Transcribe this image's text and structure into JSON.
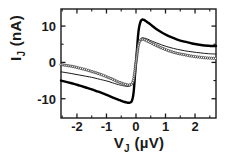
{
  "chart_data": {
    "type": "line",
    "title": "",
    "xlabel": "V_J (µV)",
    "xlabel_main": "V",
    "xlabel_sub": "J",
    "xlabel_unit": " (µV)",
    "ylabel": "I_J (nA)",
    "ylabel_main": "I",
    "ylabel_sub": "J",
    "ylabel_unit": " (nA)",
    "xlim": [
      -2.54,
      2.71
    ],
    "ylim": [
      -15.3,
      14.7
    ],
    "xticks": [
      -2,
      -1,
      0,
      1,
      2
    ],
    "xticklabels": [
      "-2",
      "-1",
      "0",
      "1",
      "2"
    ],
    "yticks": [
      -10,
      0,
      10
    ],
    "yticklabels": [
      "-10",
      "0",
      "10"
    ],
    "minor_xticks": [
      -2.5,
      -1.5,
      -0.5,
      0.5,
      1.5,
      2.5
    ],
    "minor_yticks": [
      -5,
      5
    ],
    "grid": false,
    "legend": false,
    "frame": true,
    "tick_direction": "in",
    "colors": {
      "axis": "#1a1a1a",
      "curve_thick": "#000000",
      "curve_thin": "#1a1a1a",
      "curve_marker": "#333333",
      "background": "#ffffff"
    },
    "series": [
      {
        "name": "thick-solid-curve",
        "style": "solid",
        "linewidth": 2.4,
        "marker": "none",
        "x": [
          -2.54,
          -2.3,
          -2.1,
          -1.9,
          -1.7,
          -1.5,
          -1.3,
          -1.1,
          -0.95,
          -0.8,
          -0.65,
          -0.55,
          -0.45,
          -0.38,
          -0.32,
          -0.27,
          -0.22,
          -0.18,
          -0.14,
          -0.1,
          -0.07,
          -0.04,
          -0.02,
          0.0,
          0.02,
          0.04,
          0.07,
          0.1,
          0.14,
          0.18,
          0.22,
          0.27,
          0.33,
          0.4,
          0.5,
          0.62,
          0.78,
          0.95,
          1.15,
          1.4,
          1.65,
          1.9,
          2.2,
          2.45,
          2.71
        ],
        "y": [
          -5.0,
          -5.5,
          -5.9,
          -6.4,
          -6.9,
          -7.4,
          -8.0,
          -8.6,
          -9.1,
          -9.6,
          -10.1,
          -10.4,
          -10.7,
          -10.9,
          -11.0,
          -11.1,
          -11.1,
          -11.0,
          -10.6,
          -9.4,
          -7.4,
          -4.2,
          -2.0,
          0.0,
          2.0,
          4.2,
          7.4,
          9.4,
          10.9,
          11.6,
          11.8,
          11.7,
          11.4,
          11.0,
          10.4,
          9.6,
          8.7,
          7.9,
          7.1,
          6.3,
          5.7,
          5.2,
          4.8,
          4.6,
          4.5
        ]
      },
      {
        "name": "thin-solid-curve",
        "style": "solid",
        "linewidth": 1.0,
        "marker": "none",
        "x": [
          -2.54,
          -2.3,
          -2.1,
          -1.9,
          -1.7,
          -1.5,
          -1.3,
          -1.1,
          -0.95,
          -0.8,
          -0.65,
          -0.55,
          -0.45,
          -0.38,
          -0.32,
          -0.27,
          -0.22,
          -0.18,
          -0.14,
          -0.1,
          -0.07,
          -0.04,
          -0.02,
          0.0,
          0.02,
          0.04,
          0.07,
          0.1,
          0.14,
          0.18,
          0.22,
          0.27,
          0.33,
          0.4,
          0.5,
          0.62,
          0.78,
          0.95,
          1.15,
          1.4,
          1.65,
          1.9,
          2.2,
          2.45,
          2.71
        ],
        "y": [
          -2.6,
          -2.9,
          -3.2,
          -3.5,
          -3.8,
          -4.1,
          -4.5,
          -4.9,
          -5.2,
          -5.6,
          -6.0,
          -6.2,
          -6.4,
          -6.5,
          -6.6,
          -6.6,
          -6.5,
          -6.4,
          -6.1,
          -5.4,
          -4.3,
          -2.4,
          -1.2,
          0.0,
          1.2,
          2.4,
          4.3,
          5.4,
          6.2,
          6.7,
          6.8,
          6.7,
          6.6,
          6.4,
          6.0,
          5.6,
          5.1,
          4.6,
          4.1,
          3.6,
          3.2,
          2.9,
          2.6,
          2.4,
          2.3
        ]
      },
      {
        "name": "open-circle-marker-curve",
        "style": "markers",
        "linewidth": 0.9,
        "marker": "open-circle",
        "x": [
          -2.54,
          -2.3,
          -2.1,
          -1.9,
          -1.7,
          -1.5,
          -1.3,
          -1.1,
          -0.95,
          -0.8,
          -0.65,
          -0.55,
          -0.45,
          -0.38,
          -0.32,
          -0.27,
          -0.22,
          -0.18,
          -0.14,
          -0.1,
          -0.07,
          -0.04,
          -0.02,
          0.0,
          0.02,
          0.04,
          0.07,
          0.1,
          0.14,
          0.18,
          0.22,
          0.27,
          0.33,
          0.4,
          0.5,
          0.62,
          0.78,
          0.95,
          1.15,
          1.4,
          1.65,
          1.9,
          2.2,
          2.45,
          2.71
        ],
        "y": [
          -0.6,
          -0.9,
          -1.2,
          -1.6,
          -2.0,
          -2.5,
          -3.0,
          -3.6,
          -4.1,
          -4.6,
          -5.2,
          -5.5,
          -5.8,
          -6.0,
          -6.1,
          -6.2,
          -6.2,
          -6.1,
          -5.9,
          -5.3,
          -4.2,
          -2.4,
          -1.2,
          0.0,
          1.2,
          2.4,
          4.2,
          5.3,
          6.0,
          6.3,
          6.4,
          6.3,
          6.1,
          5.8,
          5.4,
          4.9,
          4.3,
          3.7,
          3.1,
          2.5,
          2.1,
          1.7,
          1.4,
          1.2,
          1.1
        ]
      }
    ]
  }
}
